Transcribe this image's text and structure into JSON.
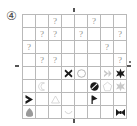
{
  "problem": {
    "number_label": "④"
  },
  "puzzle": {
    "type": "shape-grid-matrix",
    "rows": 8,
    "cols": 8,
    "unknown_marker": "?",
    "grid_line_color": "#b9b9b9",
    "question_color": "#909090",
    "dark_color": "#1a1a1a",
    "light_color": "#c9c9c9",
    "mid_color": "#9a9a9a"
  },
  "ticks": [
    {
      "name": "tick-top",
      "orient": "v",
      "left": 73,
      "top": 8
    },
    {
      "name": "tick-bottom",
      "orient": "v",
      "left": 73,
      "top": 119
    },
    {
      "name": "tick-left",
      "orient": "h",
      "left": 15,
      "top": 65
    },
    {
      "name": "tick-right",
      "orient": "h",
      "left": 127,
      "top": 65
    },
    {
      "name": "tick-corner-dot",
      "orient": "dot",
      "left": 129,
      "top": 61
    }
  ],
  "cells": [
    [
      {
        "kind": "empty"
      },
      {
        "kind": "empty"
      },
      {
        "kind": "question",
        "text": "?"
      },
      {
        "kind": "empty"
      },
      {
        "kind": "empty"
      },
      {
        "kind": "question",
        "text": "?"
      },
      {
        "kind": "empty"
      },
      {
        "kind": "empty"
      }
    ],
    [
      {
        "kind": "empty"
      },
      {
        "kind": "question",
        "text": "?"
      },
      {
        "kind": "question",
        "text": "?"
      },
      {
        "kind": "empty"
      },
      {
        "kind": "question",
        "text": "?"
      },
      {
        "kind": "empty"
      },
      {
        "kind": "empty"
      },
      {
        "kind": "question",
        "text": "?"
      }
    ],
    [
      {
        "kind": "question",
        "text": "?"
      },
      {
        "kind": "empty"
      },
      {
        "kind": "empty"
      },
      {
        "kind": "empty"
      },
      {
        "kind": "empty"
      },
      {
        "kind": "empty"
      },
      {
        "kind": "question",
        "text": "?"
      },
      {
        "kind": "empty"
      }
    ],
    [
      {
        "kind": "empty"
      },
      {
        "kind": "question",
        "text": "?"
      },
      {
        "kind": "question",
        "text": "?"
      },
      {
        "kind": "empty"
      },
      {
        "kind": "empty"
      },
      {
        "kind": "empty"
      },
      {
        "kind": "empty"
      },
      {
        "kind": "question",
        "text": "?"
      }
    ],
    [
      {
        "kind": "empty"
      },
      {
        "kind": "empty"
      },
      {
        "kind": "empty"
      },
      {
        "kind": "shape",
        "shape": "cross-x",
        "shade": "dark"
      },
      {
        "kind": "shape",
        "shape": "ellipse-outline",
        "shade": "mid"
      },
      {
        "kind": "empty"
      },
      {
        "kind": "shape",
        "shape": "arrow-right",
        "shade": "light"
      },
      {
        "kind": "shape",
        "shape": "star-6",
        "shade": "dark"
      }
    ],
    [
      {
        "kind": "empty"
      },
      {
        "kind": "shape",
        "shape": "crescent",
        "shade": "light"
      },
      {
        "kind": "empty"
      },
      {
        "kind": "empty"
      },
      {
        "kind": "empty"
      },
      {
        "kind": "shape",
        "shape": "no-entry",
        "shade": "dark"
      },
      {
        "kind": "shape",
        "shape": "pentagon",
        "shade": "light"
      },
      {
        "kind": "shape",
        "shape": "star-6",
        "shade": "light"
      }
    ],
    [
      {
        "kind": "shape",
        "shape": "chevron-right",
        "shade": "dark"
      },
      {
        "kind": "empty"
      },
      {
        "kind": "shape",
        "shape": "triangle-outline",
        "shade": "light"
      },
      {
        "kind": "empty"
      },
      {
        "kind": "empty"
      },
      {
        "kind": "shape",
        "shape": "flag",
        "shade": "dark"
      },
      {
        "kind": "empty"
      },
      {
        "kind": "empty"
      }
    ],
    [
      {
        "kind": "shape",
        "shape": "blob",
        "shade": "mid"
      },
      {
        "kind": "empty"
      },
      {
        "kind": "empty"
      },
      {
        "kind": "shape",
        "shape": "arc-smile",
        "shade": "light"
      },
      {
        "kind": "empty"
      },
      {
        "kind": "empty"
      },
      {
        "kind": "empty"
      },
      {
        "kind": "shape",
        "shape": "bowtie",
        "shade": "dark"
      }
    ]
  ]
}
